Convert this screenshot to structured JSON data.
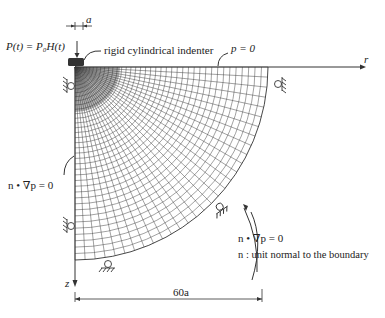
{
  "diagram": {
    "load_label": "P(t) = P₀H(t)",
    "indenter_label": "rigid cylindrical indenter",
    "indenter_width_label": "a",
    "surface_bc_label": "p = 0",
    "r_axis_label": "r",
    "z_axis_label": "z",
    "left_bc_label": "n • ∇p = 0",
    "curved_bc_label": "n • ∇p = 0",
    "normal_def_label": "n : unit normal to the boundary",
    "dimension_label": "60a",
    "colors": {
      "line": "#333333",
      "mesh": "#444444",
      "background": "#ffffff"
    },
    "mesh": {
      "shape": "quarter-disk",
      "radial_divisions": 40,
      "angular_divisions": 30,
      "refined_near": "indenter"
    },
    "supports": [
      {
        "name": "roller-left-top",
        "position": "left boundary near top"
      },
      {
        "name": "roller-left-lower",
        "position": "left boundary lower"
      },
      {
        "name": "roller-bottom",
        "position": "bottom near z-axis"
      },
      {
        "name": "roller-arc",
        "position": "curved boundary"
      },
      {
        "name": "roller-right",
        "position": "right end of surface"
      }
    ]
  }
}
